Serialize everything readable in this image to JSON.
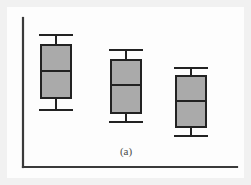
{
  "figure": {
    "caption": "(a)",
    "panel_background": "#fdfdfd",
    "margin_background": "#f1f1f1"
  },
  "chart_data": {
    "type": "box",
    "title": "",
    "subtitle": "",
    "xlabel": "",
    "ylabel": "",
    "caption": "(a)",
    "grid": false,
    "legend": null,
    "axes": {
      "y_axis_visible": true,
      "x_axis_visible": true,
      "y_axis_ticks": [],
      "x_axis_ticks": [],
      "tick_labels_shown": false,
      "axis_color": "#3a3a3a"
    },
    "style": {
      "box_fill": "#aaaaaa",
      "box_stroke": "#222222",
      "whisker_stroke": "#222222",
      "median_stroke": "#222222",
      "box_width_px": 30,
      "cap_width_px": 34
    },
    "orientation": "vertical",
    "value_axis": "inverted_pixels",
    "note": "Values are read directly off pixel positions; higher on the panel means a larger value. No numeric tick labels are printed in the figure.",
    "categories": [
      "1",
      "2",
      "3"
    ],
    "boxes": [
      {
        "name": "group-1",
        "center_x": 56,
        "upper_whisker": 35,
        "q3": 45,
        "median": 71,
        "q1": 98,
        "lower_whisker": 110,
        "box_left": 41,
        "box_right": 71,
        "cap_left": 39,
        "cap_right": 73
      },
      {
        "name": "group-2",
        "center_x": 126,
        "upper_whisker": 50,
        "q3": 60,
        "median": 85,
        "q1": 113,
        "lower_whisker": 122,
        "box_left": 111,
        "box_right": 141,
        "cap_left": 109,
        "cap_right": 143
      },
      {
        "name": "group-3",
        "center_x": 191,
        "upper_whisker": 68,
        "q3": 76,
        "median": 101,
        "q1": 127,
        "lower_whisker": 136,
        "box_left": 176,
        "box_right": 206,
        "cap_left": 174,
        "cap_right": 208
      }
    ],
    "axis_geometry": {
      "y_axis_x": 23,
      "y_axis_top": 18,
      "y_axis_bottom": 167,
      "x_axis_y": 167,
      "x_axis_left": 23,
      "x_axis_right": 237
    },
    "caption_position": {
      "x": 126,
      "y": 155
    }
  }
}
